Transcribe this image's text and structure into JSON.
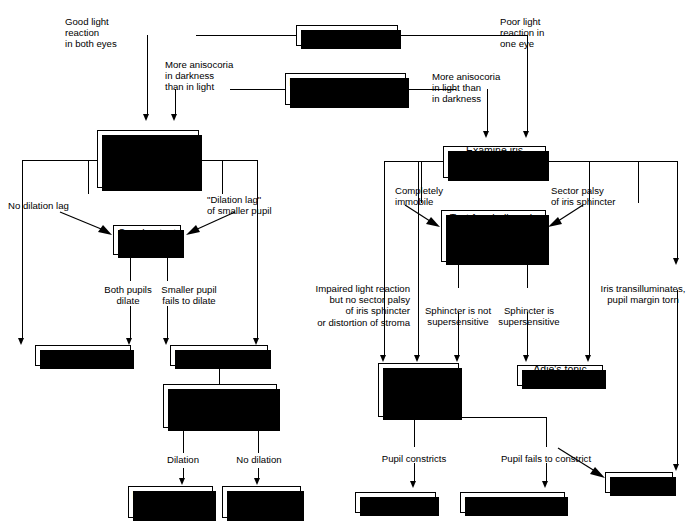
{
  "diagram": {
    "colors": {
      "ink": "#000000",
      "paper": "#ffffff"
    },
    "nodes": {
      "check_light_reaction": "Check light reaction",
      "anisocoria_question": "Is there more anisocoria\nin darkness or in light?",
      "dilation_lag": "Look for\n\"dilation lag\"\nof the smaller pupil\nwith flash photos",
      "cocaine_test": "Cocaine test\n2%–10%",
      "simple_anisocoria": "Simple anisocoria",
      "horners_syndrome": "Horner's syndrome",
      "hydroxyamphetamine_test": "1%\nhydroxyamphetamine\ntest",
      "preganglionic": "Preganglionic or\ncentral Horner's",
      "postganglionic": "Postganglionic\nHorner's",
      "examine_iris": "Examine iris\nsphincter at slit lamp",
      "cholinergic_test": "Test for cholinergic\nsupersensitivity with\nMecholyl 2.5% or\nPilocarpine 0.1%",
      "anticholinergic_test": "Test for\nanticholinergic\nblockade with\nPilocarpine 1%",
      "adies_tonic_pupil": "Adie's tonic pupil",
      "third_nerve_palsy_pre": "III",
      "third_nerve_palsy_sup": "rd",
      "third_nerve_palsy_post": " nerve palsy",
      "atropinic_mydriasis": "\"Atropinic\" mydriasis",
      "iris_damage": "Iris damage"
    },
    "edge_labels": {
      "good_light_reaction": "Good light\nreaction\nin both eyes",
      "poor_light_reaction": "Poor light\nreaction in\none eye",
      "more_aniso_dark": "More anisocoria\nin darkness\nthan in light",
      "more_aniso_light": "More anisocoria\nin light than\nin darkness",
      "no_dilation_lag": "No dilation lag",
      "dilation_lag_smaller": "\"Dilation lag\"\nof smaller pupil",
      "both_pupils_dilate": "Both pupils\ndilate",
      "smaller_fails_dilate": "Smaller pupil\nfails to dilate",
      "dilation": "Dilation",
      "no_dilation": "No dilation",
      "completely_immobile": "Completely\nimmobile",
      "sector_palsy": "Sector palsy\nof iris sphincter",
      "impaired_light_reaction": "Impaired light reaction\nbut no sector palsy\nof iris sphincter\nor distortion of stroma",
      "sphincter_not_supersensitive": "Sphincter is not\nsupersensitive",
      "sphincter_supersensitive": "Sphincter is\nsupersensitive",
      "iris_transilluminates": "Iris transilluminates,\npupil margin torn",
      "pupil_constricts": "Pupil constricts",
      "pupil_fails_constrict": "Pupil fails to constrict"
    }
  }
}
